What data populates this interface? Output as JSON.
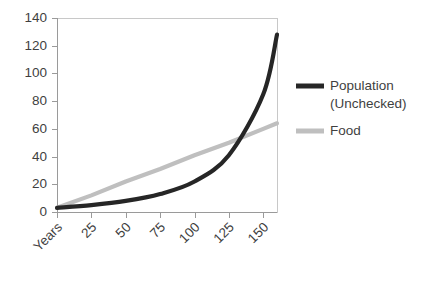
{
  "chart_data": {
    "type": "line",
    "title": "",
    "xlabel": "",
    "ylabel": "",
    "xlim": [
      0,
      160
    ],
    "ylim": [
      0,
      140
    ],
    "grid": false,
    "legend_position": "right",
    "x_tick_labels": [
      "Years",
      "25",
      "50",
      "75",
      "100",
      "125",
      "150"
    ],
    "x_tick_values": [
      0,
      25,
      50,
      75,
      100,
      125,
      150
    ],
    "y_tick_labels": [
      "0",
      "20",
      "40",
      "60",
      "80",
      "100",
      "120",
      "140"
    ],
    "y_tick_values": [
      0,
      20,
      40,
      60,
      80,
      100,
      120,
      140
    ],
    "x": [
      0,
      25,
      50,
      75,
      100,
      125,
      150,
      160
    ],
    "series": [
      {
        "name": "Population (Unchecked)",
        "color": "#262626",
        "line_width": 4.2,
        "values": [
          3,
          5,
          8,
          13,
          22,
          41,
          85,
          128
        ]
      },
      {
        "name": "Food",
        "color": "#bfbfbf",
        "line_width": 4.2,
        "values": [
          3,
          12,
          22,
          31,
          41,
          50,
          60,
          64
        ]
      }
    ],
    "annotations": [
      {
        "text": "crossover",
        "x": 118,
        "y": 50
      }
    ]
  },
  "legend": {
    "entries": [
      {
        "label_line1": "Population",
        "label_line2": "(Unchecked)",
        "swatch_color": "#262626"
      },
      {
        "label_line1": "Food",
        "label_line2": "",
        "swatch_color": "#bfbfbf"
      }
    ]
  },
  "axis_colors": {
    "axis": "#9a9a9a",
    "border": "#c8c8c8",
    "text": "#3f3f3f"
  }
}
